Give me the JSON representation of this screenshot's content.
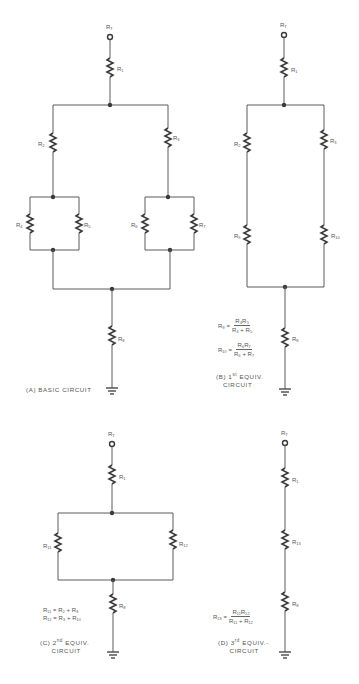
{
  "panels": {
    "a": {
      "caption": "(A) BASIC CIRCUIT",
      "labels": {
        "rt": "R",
        "rt_sub": "T",
        "r1": "R",
        "r1_sub": "1",
        "r2": "R",
        "r2_sub": "2",
        "r3": "R",
        "r3_sub": "3",
        "r4": "R",
        "r4_sub": "4",
        "r5": "R",
        "r5_sub": "5",
        "r6": "R",
        "r6_sub": "6",
        "r7": "R",
        "r7_sub": "7",
        "r8": "R",
        "r8_sub": "8"
      }
    },
    "b": {
      "caption_line1": "(B) 1",
      "caption_sup": "st",
      "caption_line1_rest": " EQUIV.",
      "caption_line2": "CIRCUIT",
      "labels": {
        "rt": "R",
        "rt_sub": "T",
        "r1": "R",
        "r1_sub": "1",
        "r2": "R",
        "r2_sub": "2",
        "r3": "R",
        "r3_sub": "3",
        "r9": "R",
        "r9_sub": "9",
        "r10": "R",
        "r10_sub": "10",
        "r8": "R",
        "r8_sub": "8"
      },
      "formulas": [
        {
          "lhs": "R₉ =",
          "num": "R₄R₅",
          "den": "R₄ + R₅"
        },
        {
          "lhs": "R₁₀ =",
          "num": "R₆R₇",
          "den": "R₆ + R₇"
        }
      ]
    },
    "c": {
      "caption_line1": "(C) 2",
      "caption_sup": "nd",
      "caption_line1_rest": " EQUIV.",
      "caption_line2": "CIRCUIT",
      "labels": {
        "rt": "R",
        "rt_sub": "T",
        "r1": "R",
        "r1_sub": "1",
        "r11": "R",
        "r11_sub": "11",
        "r12": "R",
        "r12_sub": "12",
        "r8": "R",
        "r8_sub": "8"
      },
      "formulas": [
        "R₁₁ = R₂ + R₉",
        "R₁₂ = R₃ + R₁₀"
      ]
    },
    "d": {
      "caption_line1": "(D) 3",
      "caption_sup": "rd",
      "caption_line1_rest": " EQUIV.-",
      "caption_line2": "CIRCUIT",
      "labels": {
        "rt": "R",
        "rt_sub": "T",
        "r1": "R",
        "r1_sub": "1",
        "r13": "R",
        "r13_sub": "13",
        "r8": "R",
        "r8_sub": "8"
      },
      "formulas": [
        {
          "lhs": "R₁₃ =",
          "num": "R₁₁R₁₂",
          "den": "R₁₁ + R₁₂"
        }
      ]
    }
  },
  "colors": {
    "ink": "#3a3a3a",
    "wire": "#5a5a5a",
    "text": "#555555",
    "background": "#ffffff"
  }
}
